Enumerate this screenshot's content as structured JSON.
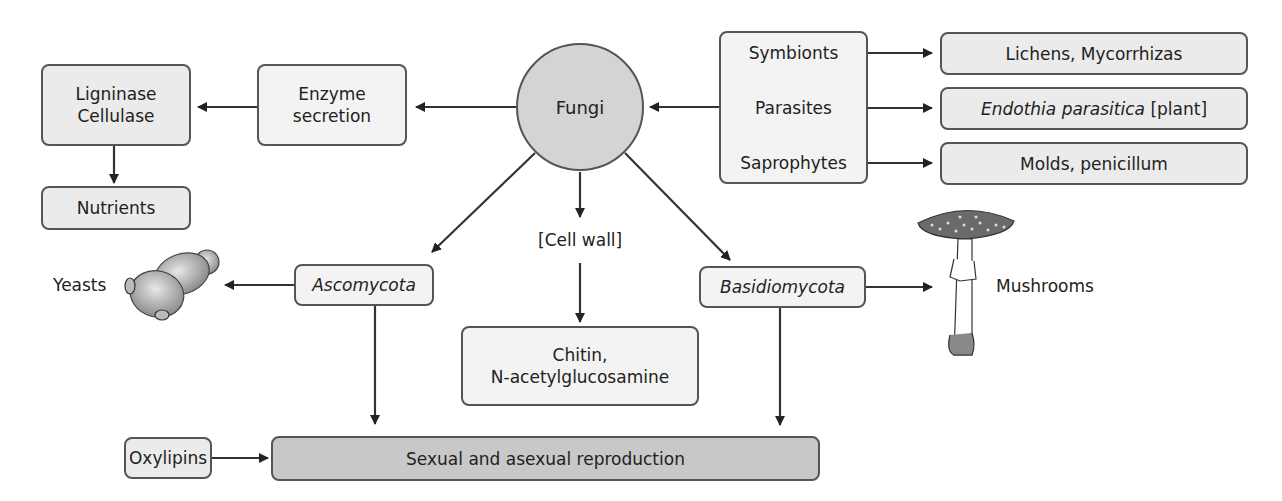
{
  "diagram": {
    "center": {
      "label": "Fungi"
    },
    "left_branch": {
      "enzyme": {
        "line1": "Enzyme",
        "line2": "secretion"
      },
      "enzymes_list": {
        "line1": "Ligninase",
        "line2": "Cellulase"
      },
      "nutrients": "Nutrients"
    },
    "right_branch": {
      "types": [
        "Symbionts",
        "Parasites",
        "Saprophytes"
      ],
      "examples": [
        {
          "italic": "Lichens, Mycorrhizas",
          "plain": "",
          "is_italic": false
        },
        {
          "italic": "Endothia parasitica",
          "plain": " [plant]",
          "is_italic": true
        },
        {
          "italic": "Molds, penicillum",
          "plain": "",
          "is_italic": false
        }
      ]
    },
    "lower": {
      "cell_wall": "[Cell wall]",
      "chitin": {
        "line1": "Chitin,",
        "line2": "N-acetylglucosamine"
      },
      "ascomycota": "Ascomycota",
      "basidiomycota": "Basidiomycota",
      "yeasts": "Yeasts",
      "mushrooms": "Mushrooms",
      "oxylipins": "Oxylipins",
      "reproduction": "Sexual and asexual reproduction"
    },
    "icons": [
      "yeast-cells-illustration",
      "mushroom-illustration"
    ],
    "colors": {
      "box_fill": "#ebebeb",
      "circle_fill": "#d4d4d4",
      "reproduction_fill": "#c8c8c8",
      "stroke": "#555555",
      "arrow": "#222222"
    }
  }
}
